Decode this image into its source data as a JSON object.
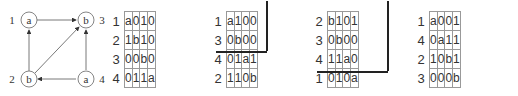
{
  "graph": {
    "nodes": [
      {
        "id": "1",
        "label": "a",
        "x": 20,
        "y": 20
      },
      {
        "id": "3",
        "label": "b",
        "x": 86,
        "y": 20
      },
      {
        "id": "2",
        "label": "b",
        "x": 28,
        "y": 80
      },
      {
        "id": "4",
        "label": "a",
        "x": 86,
        "y": 80
      }
    ],
    "edges": [
      [
        "1",
        "3"
      ],
      [
        "2",
        "1"
      ],
      [
        "2",
        "3"
      ],
      [
        "4",
        "3"
      ],
      [
        "4",
        "2"
      ]
    ]
  },
  "matrices": [
    {
      "row_labels": [
        "1",
        "2",
        "3",
        "4"
      ],
      "rows": [
        [
          "a",
          "0",
          "1",
          "0"
        ],
        [
          "1",
          "b",
          "1",
          "0"
        ],
        [
          "0",
          "0",
          "b",
          "0"
        ],
        [
          "0",
          "1",
          "1",
          "a"
        ]
      ]
    },
    {
      "row_labels": [
        "1",
        "3",
        "4",
        "2"
      ],
      "rows": [
        [
          "a",
          "1",
          "0",
          "0"
        ],
        [
          "0",
          "b",
          "0",
          "0"
        ],
        [
          "0",
          "1",
          "a",
          "1"
        ],
        [
          "1",
          "1",
          "0",
          "b"
        ]
      ],
      "thick_block": 2
    },
    {
      "row_labels": [
        "2",
        "3",
        "4",
        "1"
      ],
      "rows": [
        [
          "b",
          "1",
          "0",
          "1"
        ],
        [
          "0",
          "b",
          "0",
          "0"
        ],
        [
          "1",
          "1",
          "a",
          "0"
        ],
        [
          "0",
          "1",
          "0",
          "a"
        ]
      ],
      "thick_block": 3
    },
    {
      "row_labels": [
        "1",
        "4",
        "2",
        "3"
      ],
      "rows": [
        [
          "a",
          "0",
          "0",
          "1"
        ],
        [
          "0",
          "a",
          "1",
          "1"
        ],
        [
          "1",
          "0",
          "b",
          "1"
        ],
        [
          "0",
          "0",
          "0",
          "b"
        ]
      ]
    }
  ]
}
